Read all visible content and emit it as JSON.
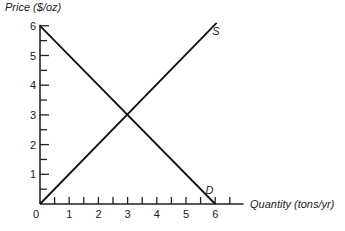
{
  "chart_data": {
    "type": "line",
    "title": "",
    "xlabel": "Quantity (tons/yr)",
    "ylabel": "Price ($/oz)",
    "xlim": [
      0,
      6.7
    ],
    "ylim": [
      0,
      6
    ],
    "x_ticks": [
      0.5,
      1,
      1.5,
      2,
      2.5,
      3,
      3.5,
      4,
      4.5,
      5,
      5.5,
      6,
      6.5
    ],
    "x_tick_labels": [
      "0",
      "1",
      "2",
      "3",
      "4",
      "5",
      "6"
    ],
    "y_ticks": [
      0.5,
      1,
      1.5,
      2,
      2.5,
      3,
      3.5,
      4,
      4.5,
      5,
      5.5,
      6
    ],
    "y_tick_labels": [
      "1",
      "2",
      "3",
      "4",
      "5",
      "6"
    ],
    "grid": false,
    "series": [
      {
        "name": "S",
        "label": "S",
        "x": [
          0,
          6.05
        ],
        "y": [
          0,
          6.1
        ]
      },
      {
        "name": "D",
        "label": "D",
        "x": [
          0,
          6
        ],
        "y": [
          6,
          0
        ]
      }
    ],
    "annotations": [
      {
        "text": "S",
        "near": "upper end of supply line"
      },
      {
        "text": "D",
        "near": "lower end of demand line"
      }
    ]
  }
}
